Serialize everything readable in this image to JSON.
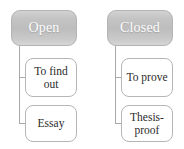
{
  "diagram": {
    "background_color": "#ffffff",
    "root_fill_color": "#c4c4c4",
    "root_text_color": "#ffffff",
    "child_fill_color": "#ffffff",
    "child_text_color": "#2b2b2b",
    "border_color": "#b4b4b4",
    "connector_color": "#a9a9a9",
    "branches": [
      {
        "root": "Open",
        "children": [
          {
            "lines": [
              "To find",
              "out"
            ],
            "text": "To find out"
          },
          {
            "lines": [
              "Essay"
            ],
            "text": "Essay"
          }
        ]
      },
      {
        "root": "Closed",
        "children": [
          {
            "lines": [
              "To prove"
            ],
            "text": "To prove"
          },
          {
            "lines": [
              "Thesis-",
              "proof"
            ],
            "text": "Thesis-proof"
          }
        ]
      }
    ]
  }
}
